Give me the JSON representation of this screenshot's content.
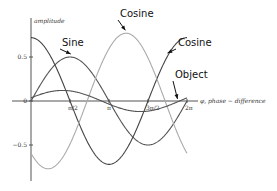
{
  "chart_data": {
    "type": "line",
    "title": "",
    "xlabel": "φ, phase − difference",
    "ylabel": "amplitude",
    "xlim": [
      0,
      6.2832
    ],
    "ylim": [
      -0.75,
      0.78
    ],
    "grid": false,
    "x_ticks": [
      {
        "value": 1.5708,
        "label": "π/2"
      },
      {
        "value": 3.1416,
        "label": "π"
      },
      {
        "value": 4.7124,
        "label": "3π/2"
      },
      {
        "value": 6.2832,
        "label": "2π"
      }
    ],
    "y_ticks": [
      {
        "value": 0.5,
        "label": "0.5"
      },
      {
        "value": 0,
        "label": "0"
      },
      {
        "value": -0.5,
        "label": "−0.5"
      }
    ],
    "series": [
      {
        "name": "Sine",
        "function": "a*sin(x+p)",
        "amplitude": 0.5,
        "phase": 0,
        "color": "#555555"
      },
      {
        "name": "Cosine (dark)",
        "function": "a*cos(x+p)",
        "amplitude": 0.72,
        "phase": 0,
        "color": "#444444"
      },
      {
        "name": "Cosine (light)",
        "function": "a*cos(x+p)",
        "amplitude": 0.77,
        "phase": -3.83,
        "color": "#aaaaaa"
      },
      {
        "name": "Object",
        "function": "a*sin(x+p)",
        "amplitude": 0.12,
        "phase": 0.3,
        "color": "#555555"
      }
    ],
    "annotations": [
      {
        "text": "Cosine",
        "target_series": 2,
        "target_x": 3.8
      },
      {
        "text": "Sine",
        "target_series": 0,
        "target_x": 1.6
      },
      {
        "text": "Cosine",
        "target_series": 1,
        "target_x": 5.5
      },
      {
        "text": "Object",
        "target_series": 3,
        "target_x": 5.9
      }
    ]
  }
}
